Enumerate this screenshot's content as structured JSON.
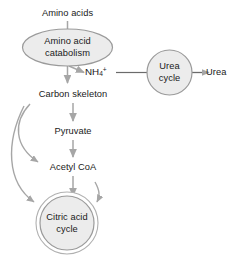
{
  "diagram": {
    "colors": {
      "shape_fill": "#ececec",
      "shape_stroke": "#9a9a9a",
      "arrow": "#a6a6a6",
      "text": "#1a1a1a",
      "background": "#ffffff"
    },
    "nodes": [
      {
        "id": "amino-acids",
        "label": "Amino acids",
        "shape": "text"
      },
      {
        "id": "amino-acid-catabolism",
        "label_line1": "Amino acid",
        "label_line2": "catabolism",
        "shape": "ellipse"
      },
      {
        "id": "ammonium",
        "label": "NH4+",
        "symbol": "NH",
        "subscript": "4",
        "superscript": "+",
        "shape": "text"
      },
      {
        "id": "urea-cycle",
        "label_line1": "Urea",
        "label_line2": "cycle",
        "shape": "circle"
      },
      {
        "id": "urea",
        "label": "Urea",
        "shape": "text"
      },
      {
        "id": "carbon-skeleton",
        "label": "Carbon skeleton",
        "shape": "text"
      },
      {
        "id": "pyruvate",
        "label": "Pyruvate",
        "shape": "text"
      },
      {
        "id": "acetyl-coa",
        "label": "Acetyl CoA",
        "shape": "text"
      },
      {
        "id": "citric-acid-cycle",
        "label_line1": "Citric acid",
        "label_line2": "cycle",
        "shape": "double-circle"
      }
    ],
    "edges": [
      {
        "from": "amino-acids",
        "to": "amino-acid-catabolism",
        "style": "straight-down"
      },
      {
        "from": "amino-acid-catabolism",
        "to": "carbon-skeleton",
        "style": "straight-down"
      },
      {
        "from": "amino-acid-catabolism",
        "to": "ammonium",
        "style": "diagonal"
      },
      {
        "from": "ammonium",
        "to": "urea-cycle",
        "style": "plain-line"
      },
      {
        "from": "urea-cycle",
        "to": "urea",
        "style": "straight-right"
      },
      {
        "from": "carbon-skeleton",
        "to": "pyruvate",
        "style": "straight-down"
      },
      {
        "from": "pyruvate",
        "to": "acetyl-coa",
        "style": "straight-down"
      },
      {
        "from": "acetyl-coa",
        "to": "citric-acid-cycle",
        "style": "straight-down"
      },
      {
        "from": "carbon-skeleton",
        "to": "acetyl-coa",
        "style": "curved-left"
      },
      {
        "from": "carbon-skeleton",
        "to": "citric-acid-cycle",
        "style": "curved-left-long"
      }
    ]
  }
}
